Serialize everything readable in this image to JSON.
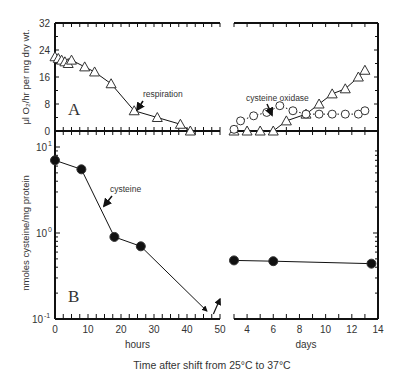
{
  "figure": {
    "xlabel": "Time after shift from 25°C to 37°C",
    "left_xlabel": "hours",
    "right_xlabel": "days",
    "panel_a_label": "A",
    "panel_b_label": "B",
    "panel_a_ylabel": "μl O₂/hr per mg dry wt.",
    "panel_b_ylabel": "nmoles cysteine/mg protein",
    "annotations": [
      "respiration",
      "cysteine oxidase",
      "cysteine"
    ]
  },
  "chart_data": [
    {
      "type": "line",
      "panel": "A",
      "title": "",
      "xlabel": "hours | days",
      "ylabel": "μl O₂/hr per mg dry wt.",
      "ylim": [
        0,
        32
      ],
      "yticks": [
        0,
        8,
        16,
        24,
        32
      ],
      "x_hours_ticks": [
        0,
        10,
        20,
        30,
        40,
        50
      ],
      "x_days_ticks": [
        4,
        6,
        8,
        10,
        12,
        14
      ],
      "series": [
        {
          "name": "respiration",
          "marker": "open-triangle",
          "hours": [
            [
              0,
              22
            ],
            [
              1,
              21.5
            ],
            [
              2,
              21
            ],
            [
              3,
              20.5
            ],
            [
              4,
              20
            ],
            [
              5,
              21
            ],
            [
              9,
              19
            ],
            [
              12,
              17.5
            ],
            [
              17,
              14
            ],
            [
              24,
              6
            ],
            [
              31,
              4
            ],
            [
              38,
              2
            ],
            [
              41,
              0
            ]
          ],
          "days": [
            [
              3,
              0
            ],
            [
              4,
              0
            ],
            [
              5,
              0
            ],
            [
              6,
              0
            ],
            [
              7,
              3
            ],
            [
              8.5,
              5
            ],
            [
              9.5,
              8
            ],
            [
              10.5,
              11
            ],
            [
              11.5,
              12.5
            ],
            [
              12.5,
              16
            ],
            [
              13,
              18
            ]
          ]
        },
        {
          "name": "cysteine oxidase",
          "marker": "open-circle",
          "hours": [],
          "days": [
            [
              3,
              0.5
            ],
            [
              3.5,
              3
            ],
            [
              4.5,
              4.5
            ],
            [
              5.5,
              5.5
            ],
            [
              6.5,
              7.5
            ],
            [
              7.5,
              6
            ],
            [
              8.5,
              5
            ],
            [
              9.5,
              5
            ],
            [
              10.5,
              5
            ],
            [
              11.5,
              5
            ],
            [
              12.5,
              5
            ],
            [
              13,
              6
            ]
          ]
        }
      ]
    },
    {
      "type": "line",
      "panel": "B",
      "title": "",
      "xlabel": "hours | days",
      "ylabel": "nmoles cysteine/mg protein",
      "yscale": "log",
      "ylim": [
        0.1,
        10
      ],
      "yticks": [
        "10^-1",
        "10^0",
        "10^1"
      ],
      "x_hours_ticks": [
        0,
        10,
        20,
        30,
        40,
        50
      ],
      "x_days_ticks": [
        4,
        6,
        8,
        10,
        12,
        14
      ],
      "series": [
        {
          "name": "cysteine",
          "marker": "filled-circle",
          "hours": [
            [
              0,
              7
            ],
            [
              8,
              5.5
            ],
            [
              18,
              0.9
            ],
            [
              26,
              0.7
            ]
          ],
          "days": [
            [
              3,
              0.48
            ],
            [
              6,
              0.47
            ],
            [
              13.5,
              0.44
            ]
          ]
        }
      ]
    }
  ]
}
